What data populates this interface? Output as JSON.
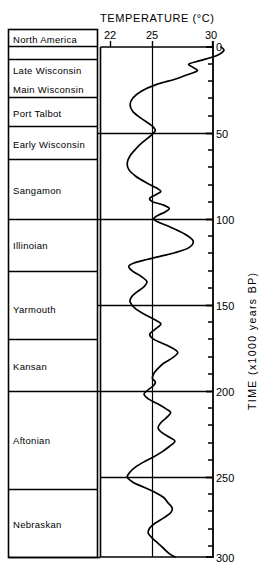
{
  "chart_data": {
    "type": "line",
    "title": "TEMPERATURE (°C)",
    "xlabel": "TEMPERATURE (°C)",
    "ylabel": "TIME (x1000 years BP)",
    "xlim": [
      21.0,
      31.2
    ],
    "ylim": [
      0,
      300
    ],
    "x_ticks": [
      22,
      25,
      30
    ],
    "x_tick_labels": [
      "22",
      "25",
      "30"
    ],
    "y_ticks": [
      0,
      10,
      20,
      30,
      40,
      50,
      60,
      70,
      80,
      90,
      100,
      110,
      120,
      130,
      140,
      150,
      160,
      170,
      180,
      190,
      200,
      210,
      220,
      230,
      240,
      250,
      260,
      270,
      280,
      290,
      300
    ],
    "y_tick_labels": [
      "0",
      "50",
      "100",
      "150",
      "200",
      "250",
      "300"
    ],
    "y_labeled_ticks": [
      0,
      50,
      100,
      150,
      200,
      250,
      300
    ],
    "y_inverted": true,
    "grid": false,
    "reference_line_x": 25,
    "axis_note": "x increases to the right; time increases downward",
    "series": [
      {
        "name": "Sea-surface temperature",
        "units": "°C",
        "points": [
          [
            29.9,
            0
          ],
          [
            30.1,
            2
          ],
          [
            29.6,
            5
          ],
          [
            28.4,
            8
          ],
          [
            27.6,
            10
          ],
          [
            27.9,
            12
          ],
          [
            28.2,
            14
          ],
          [
            27.6,
            16
          ],
          [
            26.6,
            19
          ],
          [
            25.3,
            22
          ],
          [
            24.2,
            26
          ],
          [
            23.6,
            30
          ],
          [
            23.4,
            34
          ],
          [
            23.6,
            38
          ],
          [
            24.2,
            42
          ],
          [
            24.9,
            46
          ],
          [
            25.2,
            49
          ],
          [
            24.9,
            52
          ],
          [
            24.3,
            56
          ],
          [
            23.8,
            60
          ],
          [
            23.4,
            64
          ],
          [
            23.2,
            68
          ],
          [
            23.3,
            72
          ],
          [
            23.8,
            76
          ],
          [
            24.6,
            80
          ],
          [
            25.3,
            83
          ],
          [
            25.6,
            85
          ],
          [
            25.2,
            87
          ],
          [
            24.8,
            89
          ],
          [
            25.0,
            91
          ],
          [
            25.8,
            93
          ],
          [
            26.2,
            95
          ],
          [
            25.9,
            97
          ],
          [
            25.4,
            99
          ],
          [
            25.1,
            101
          ],
          [
            25.4,
            103
          ],
          [
            26.3,
            106
          ],
          [
            27.3,
            110
          ],
          [
            27.9,
            114
          ],
          [
            27.6,
            118
          ],
          [
            26.6,
            121
          ],
          [
            25.6,
            123
          ],
          [
            24.6,
            125
          ],
          [
            23.7,
            127
          ],
          [
            23.3,
            129
          ],
          [
            23.6,
            132
          ],
          [
            24.2,
            135
          ],
          [
            24.6,
            138
          ],
          [
            24.4,
            141
          ],
          [
            23.9,
            144
          ],
          [
            23.5,
            147
          ],
          [
            23.4,
            150
          ],
          [
            23.8,
            154
          ],
          [
            24.6,
            158
          ],
          [
            25.3,
            161
          ],
          [
            25.6,
            163
          ],
          [
            25.2,
            166
          ],
          [
            24.8,
            169
          ],
          [
            25.1,
            172
          ],
          [
            25.9,
            175
          ],
          [
            26.6,
            178
          ],
          [
            26.8,
            180
          ],
          [
            26.4,
            183
          ],
          [
            25.8,
            186
          ],
          [
            25.4,
            189
          ],
          [
            25.1,
            192
          ],
          [
            25.0,
            195
          ],
          [
            25.2,
            197
          ],
          [
            25.1,
            199
          ],
          [
            24.8,
            201
          ],
          [
            24.4,
            204
          ],
          [
            24.7,
            207
          ],
          [
            25.4,
            210
          ],
          [
            26.0,
            213
          ],
          [
            26.3,
            215
          ],
          [
            26.0,
            218
          ],
          [
            25.6,
            221
          ],
          [
            25.4,
            224
          ],
          [
            25.7,
            227
          ],
          [
            26.3,
            230
          ],
          [
            26.6,
            232
          ],
          [
            26.2,
            235
          ],
          [
            25.7,
            238
          ],
          [
            25.1,
            241
          ],
          [
            24.4,
            244
          ],
          [
            23.8,
            247
          ],
          [
            23.4,
            250
          ],
          [
            23.2,
            253
          ],
          [
            23.6,
            256
          ],
          [
            24.4,
            259
          ],
          [
            25.2,
            262
          ],
          [
            25.8,
            265
          ],
          [
            26.1,
            268
          ],
          [
            26.4,
            271
          ],
          [
            26.3,
            274
          ],
          [
            25.8,
            277
          ],
          [
            25.2,
            280
          ],
          [
            24.8,
            283
          ],
          [
            24.7,
            286
          ],
          [
            25.0,
            289
          ],
          [
            25.4,
            292
          ],
          [
            25.8,
            295
          ],
          [
            26.2,
            298
          ],
          [
            26.6,
            300
          ]
        ]
      }
    ],
    "annotations": []
  },
  "header": {
    "column_title": "North America",
    "temperature_title": "TEMPERATURE (°C)",
    "time_axis_title": "TIME (x1000 years BP)"
  },
  "stratigraphy": {
    "units": [
      {
        "label": "Late Wisconsin",
        "top": 10,
        "bottom": 25
      },
      {
        "label": "Main Wisconsin",
        "top": 25,
        "bottom": 42
      },
      {
        "label": "Port Talbot",
        "top": 42,
        "bottom": 58
      },
      {
        "label": "Early Wisconsin",
        "top": 58,
        "bottom": 80
      },
      {
        "label": "Sangamon",
        "top": 80,
        "bottom": 107
      },
      {
        "label": "Illinoian",
        "top": 107,
        "bottom": 140
      },
      {
        "label": "Yarmouth",
        "top": 140,
        "bottom": 172
      },
      {
        "label": "Kansan",
        "top": 172,
        "bottom": 200
      },
      {
        "label": "Aftonian",
        "top": 200,
        "bottom": 258
      },
      {
        "label": "Nebraskan",
        "top": 258,
        "bottom": 300
      }
    ]
  },
  "x_axis": {
    "ticks": [
      {
        "value": 22,
        "label": "22"
      },
      {
        "value": 25,
        "label": "25"
      },
      {
        "value": 30,
        "label": "30"
      }
    ]
  },
  "y_axis": {
    "labels": [
      {
        "value": 0,
        "label": "0"
      },
      {
        "value": 50,
        "label": "50"
      },
      {
        "value": 100,
        "label": "100"
      },
      {
        "value": 150,
        "label": "150"
      },
      {
        "value": 200,
        "label": "200"
      },
      {
        "value": 250,
        "label": "250"
      },
      {
        "value": 300,
        "label": "300"
      }
    ]
  }
}
